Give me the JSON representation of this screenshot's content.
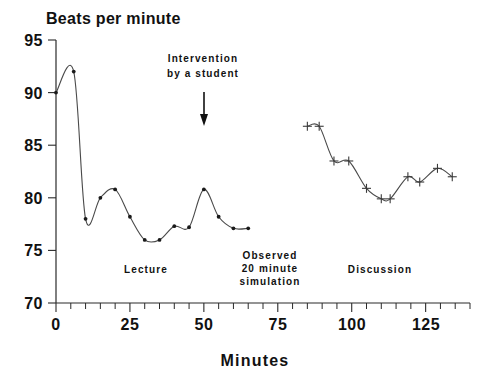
{
  "chart_data": {
    "type": "line",
    "title": "Beats per minute",
    "xlabel": "Minutes",
    "ylabel": "Beats per minute",
    "xlim": [
      0,
      140
    ],
    "ylim": [
      70,
      95
    ],
    "grid": false,
    "legend": "none",
    "x_ticks_major": [
      0,
      25,
      50,
      75,
      100,
      125
    ],
    "x_tick_labels": [
      "0",
      "25",
      "50",
      "75",
      "100",
      "125"
    ],
    "x_minor_step": 5,
    "y_ticks_major": [
      70,
      75,
      80,
      85,
      90,
      95
    ],
    "y_tick_labels": [
      "70",
      "75",
      "80",
      "85",
      "90",
      "95"
    ],
    "series": [
      {
        "name": "Lecture",
        "marker": "dot",
        "x": [
          0,
          6,
          10,
          15,
          20,
          25,
          30,
          35,
          40,
          45,
          50,
          55,
          60,
          65
        ],
        "values": [
          90.0,
          92.0,
          78.0,
          80.0,
          80.8,
          78.2,
          76.0,
          76.0,
          77.3,
          77.2,
          80.8,
          78.2,
          77.1,
          77.1
        ]
      },
      {
        "name": "Discussion",
        "marker": "plus",
        "x": [
          85,
          89,
          94,
          99,
          105,
          110,
          113,
          119,
          123,
          129,
          134
        ],
        "values": [
          86.8,
          86.8,
          83.5,
          83.5,
          80.9,
          79.9,
          79.9,
          82.0,
          81.5,
          82.8,
          82.0
        ]
      }
    ],
    "annotations": [
      {
        "name": "intervention",
        "text_lines": [
          "Intervention",
          "by a student"
        ],
        "arrow": true,
        "x": 50
      },
      {
        "name": "lecture-label",
        "text_lines": [
          "Lecture"
        ],
        "x": 25
      },
      {
        "name": "observed-label",
        "text_lines": [
          "Observed",
          "20 minute",
          "simulation"
        ],
        "x": 70
      },
      {
        "name": "discussion-label",
        "text_lines": [
          "Discussion"
        ],
        "x": 110
      }
    ]
  },
  "labels": {
    "title": "Beats per minute",
    "xaxis_title": "Minutes",
    "annotation_intervention_line1": "Intervention",
    "annotation_intervention_line2": "by a student",
    "segment_lecture": "Lecture",
    "segment_observed_line1": "Observed",
    "segment_observed_line2": "20 minute",
    "segment_observed_line3": "simulation",
    "segment_discussion": "Discussion",
    "y_tick_95": "95",
    "y_tick_90": "90",
    "y_tick_85": "85",
    "y_tick_80": "80",
    "y_tick_75": "75",
    "y_tick_70": "70",
    "x_tick_0": "0",
    "x_tick_25": "25",
    "x_tick_50": "50",
    "x_tick_75": "75",
    "x_tick_100": "100",
    "x_tick_125": "125"
  },
  "colors": {
    "background": "#ffffff",
    "axis": "#2a2a2a",
    "curve": "#4a4a4a",
    "marker": "#1a1a1a",
    "text": "#111111"
  }
}
